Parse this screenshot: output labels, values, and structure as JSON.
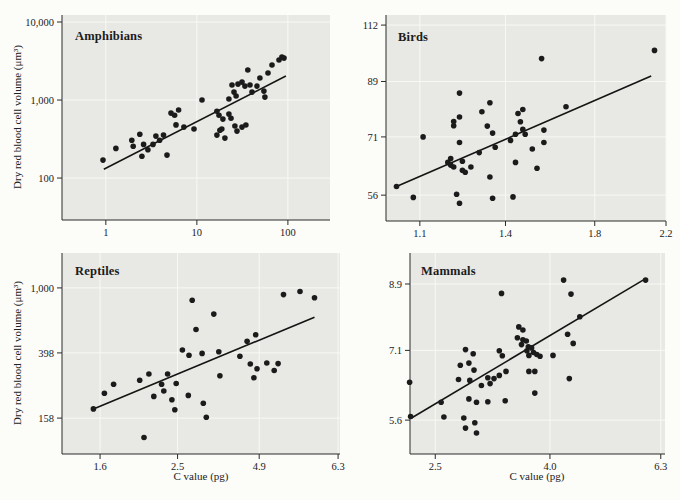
{
  "labels": {
    "xlabel": "C value (pg)",
    "ylabel": "Dry red blood cell volume (μm³)"
  },
  "style": {
    "page_bg": "#fcfcf9",
    "panel_bg": "#e8e8e4",
    "grid_color": "#f8f8f5",
    "axis_color": "#2a2a2a",
    "dot_color": "#1b1b1b",
    "trend_color": "#141414",
    "text_color": "#222222"
  },
  "chart_data": [
    {
      "type": "scatter",
      "title": "Amphibians",
      "xlabel": "C value (pg)",
      "ylabel": "Dry red blood cell volume (μm³)",
      "x_scale": "log",
      "y_scale": "log",
      "xlim": [
        0.33,
        290
      ],
      "ylim": [
        29,
        12300
      ],
      "x_ticks": [
        {
          "v": 1,
          "label": "1"
        },
        {
          "v": 10,
          "label": "10"
        },
        {
          "v": 100,
          "label": "100"
        }
      ],
      "y_ticks": [
        {
          "v": 100,
          "label": "100"
        },
        {
          "v": 1000,
          "label": "1,000"
        },
        {
          "v": 10000,
          "label": "10,000"
        }
      ],
      "trend_line": {
        "x1": 0.95,
        "y1": 130,
        "x2": 95,
        "y2": 2030
      },
      "points": [
        [
          0.93,
          170
        ],
        [
          1.29,
          240
        ],
        [
          1.93,
          305
        ],
        [
          2.0,
          255
        ],
        [
          2.36,
          365
        ],
        [
          2.49,
          190
        ],
        [
          2.6,
          270
        ],
        [
          2.9,
          230
        ],
        [
          3.3,
          270
        ],
        [
          3.55,
          345
        ],
        [
          3.9,
          305
        ],
        [
          4.3,
          355
        ],
        [
          4.7,
          197
        ],
        [
          5.2,
          680
        ],
        [
          5.7,
          640
        ],
        [
          5.9,
          480
        ],
        [
          6.3,
          745
        ],
        [
          7.2,
          450
        ],
        [
          9.3,
          425
        ],
        [
          11.4,
          1000
        ],
        [
          16.6,
          720
        ],
        [
          16.6,
          355
        ],
        [
          17.5,
          640
        ],
        [
          17.9,
          410
        ],
        [
          18.8,
          425
        ],
        [
          19.3,
          570
        ],
        [
          20.3,
          325
        ],
        [
          22.5,
          1030
        ],
        [
          22.5,
          660
        ],
        [
          23.7,
          585
        ],
        [
          24.3,
          1560
        ],
        [
          25.6,
          1265
        ],
        [
          27,
          1125
        ],
        [
          26.2,
          465
        ],
        [
          27.6,
          400
        ],
        [
          28.3,
          1600
        ],
        [
          31.3,
          1700
        ],
        [
          31.3,
          450
        ],
        [
          33.7,
          1510
        ],
        [
          34.6,
          478
        ],
        [
          36.3,
          2425
        ],
        [
          38.3,
          1560
        ],
        [
          40.3,
          1265
        ],
        [
          45.7,
          1510
        ],
        [
          49.3,
          1915
        ],
        [
          54.5,
          1300
        ],
        [
          55.9,
          1090
        ],
        [
          60.5,
          2220
        ],
        [
          66.8,
          2810
        ],
        [
          79.8,
          3260
        ],
        [
          86,
          3555
        ],
        [
          90.5,
          3450
        ]
      ]
    },
    {
      "type": "scatter",
      "title": "Birds",
      "xlabel": "C value (pg)",
      "ylabel": "Dry red blood cell volume (μm³)",
      "x_scale": "log",
      "y_scale": "log",
      "xlim": [
        1.0,
        2.2
      ],
      "ylim": [
        50.4,
        116.7
      ],
      "x_ticks": [
        {
          "v": 1.1,
          "label": "1.1"
        },
        {
          "v": 1.4,
          "label": "1.4"
        },
        {
          "v": 1.8,
          "label": "1.8"
        },
        {
          "v": 2.2,
          "label": "2.2"
        }
      ],
      "y_ticks": [
        {
          "v": 56,
          "label": "56"
        },
        {
          "v": 71,
          "label": "71"
        },
        {
          "v": 89,
          "label": "89"
        },
        {
          "v": 112,
          "label": "112"
        }
      ],
      "trend_line": {
        "x1": 1.03,
        "y1": 58,
        "x2": 2.11,
        "y2": 91
      },
      "points": [
        [
          1.03,
          58
        ],
        [
          1.08,
          55.5
        ],
        [
          1.11,
          71
        ],
        [
          1.19,
          64
        ],
        [
          1.2,
          65
        ],
        [
          1.2,
          63.3
        ],
        [
          1.21,
          75.6
        ],
        [
          1.21,
          74.3
        ],
        [
          1.21,
          62.8
        ],
        [
          1.22,
          56.2
        ],
        [
          1.23,
          84.9
        ],
        [
          1.23,
          77
        ],
        [
          1.23,
          54.2
        ],
        [
          1.23,
          69.4
        ],
        [
          1.24,
          64.3
        ],
        [
          1.24,
          62
        ],
        [
          1.25,
          61.5
        ],
        [
          1.27,
          62.8
        ],
        [
          1.3,
          66.6
        ],
        [
          1.31,
          78.7
        ],
        [
          1.33,
          74.2
        ],
        [
          1.34,
          81.6
        ],
        [
          1.35,
          72.1
        ],
        [
          1.36,
          68.1
        ],
        [
          1.34,
          60.3
        ],
        [
          1.35,
          55.3
        ],
        [
          1.43,
          55.6
        ],
        [
          1.42,
          70
        ],
        [
          1.44,
          71.8
        ],
        [
          1.45,
          78.1
        ],
        [
          1.46,
          75.5
        ],
        [
          1.47,
          79.4
        ],
        [
          1.47,
          73.2
        ],
        [
          1.48,
          71.8
        ],
        [
          1.44,
          64
        ],
        [
          1.51,
          67.6
        ],
        [
          1.53,
          62.5
        ],
        [
          1.56,
          69.4
        ],
        [
          1.56,
          73
        ],
        [
          1.55,
          97.7
        ],
        [
          1.66,
          80.3
        ],
        [
          2.13,
          101
        ]
      ]
    },
    {
      "type": "scatter",
      "title": "Reptiles",
      "xlabel": "C value (pg)",
      "ylabel": "Dry red blood cell volume (μm³)",
      "x_scale": "log",
      "y_scale": "log",
      "xlim": [
        1.285,
        6.37
      ],
      "ylim": [
        95,
        1640
      ],
      "x_ticks": [
        {
          "v": 1.6,
          "label": "1.6"
        },
        {
          "v": 2.5,
          "label": "2.5"
        },
        {
          "v": 4.0,
          "label": "4.9"
        },
        {
          "v": 6.3,
          "label": "6.3"
        }
      ],
      "y_ticks": [
        {
          "v": 158,
          "label": "158"
        },
        {
          "v": 398,
          "label": "398"
        },
        {
          "v": 1000,
          "label": "1,000"
        }
      ],
      "trend_line": {
        "x1": 1.54,
        "y1": 180,
        "x2": 5.5,
        "y2": 660
      },
      "points": [
        [
          1.54,
          180
        ],
        [
          1.64,
          225
        ],
        [
          1.73,
          255
        ],
        [
          2.01,
          270
        ],
        [
          2.06,
          120
        ],
        [
          2.12,
          295
        ],
        [
          2.18,
          215
        ],
        [
          2.28,
          255
        ],
        [
          2.31,
          232
        ],
        [
          2.36,
          295
        ],
        [
          2.42,
          205
        ],
        [
          2.46,
          178
        ],
        [
          2.48,
          258
        ],
        [
          2.57,
          415
        ],
        [
          2.66,
          218
        ],
        [
          2.67,
          385
        ],
        [
          2.72,
          840
        ],
        [
          2.78,
          555
        ],
        [
          2.88,
          395
        ],
        [
          2.9,
          195
        ],
        [
          2.95,
          160
        ],
        [
          3.08,
          690
        ],
        [
          3.17,
          405
        ],
        [
          3.19,
          288
        ],
        [
          3.58,
          380
        ],
        [
          3.73,
          470
        ],
        [
          3.8,
          340
        ],
        [
          3.88,
          280
        ],
        [
          3.92,
          515
        ],
        [
          3.95,
          318
        ],
        [
          4.18,
          345
        ],
        [
          4.36,
          310
        ],
        [
          4.46,
          342
        ],
        [
          4.6,
          910
        ],
        [
          5.06,
          950
        ],
        [
          5.5,
          870
        ]
      ]
    },
    {
      "type": "scatter",
      "title": "Mammals",
      "xlabel": "C value (pg)",
      "ylabel": "Dry red blood cell volume (μm³)",
      "x_scale": "log",
      "y_scale": "log",
      "xlim": [
        2.254,
        6.41
      ],
      "ylim": [
        4.99,
        9.89
      ],
      "x_ticks": [
        {
          "v": 2.5,
          "label": "2.5"
        },
        {
          "v": 4.0,
          "label": "4.0"
        },
        {
          "v": 6.3,
          "label": "6.3"
        }
      ],
      "y_ticks": [
        {
          "v": 5.6,
          "label": "5.6"
        },
        {
          "v": 7.1,
          "label": "7.1"
        },
        {
          "v": 8.9,
          "label": "8.9"
        }
      ],
      "trend_line": {
        "x1": 2.26,
        "y1": 5.63,
        "x2": 5.9,
        "y2": 9.05
      },
      "points": [
        [
          2.25,
          6.37
        ],
        [
          2.26,
          5.67
        ],
        [
          2.56,
          5.95
        ],
        [
          2.59,
          5.66
        ],
        [
          2.81,
          5.64
        ],
        [
          2.83,
          5.45
        ],
        [
          2.94,
          5.55
        ],
        [
          2.96,
          5.36
        ],
        [
          2.87,
          6.02
        ],
        [
          2.96,
          5.95
        ],
        [
          3.1,
          5.96
        ],
        [
          3.33,
          5.98
        ],
        [
          2.77,
          6.75
        ],
        [
          2.87,
          6.8
        ],
        [
          2.93,
          6.64
        ],
        [
          2.83,
          7.12
        ],
        [
          2.92,
          7.02
        ],
        [
          2.75,
          6.43
        ],
        [
          2.88,
          6.41
        ],
        [
          3.02,
          6.3
        ],
        [
          3.13,
          6.34
        ],
        [
          3.1,
          6.47
        ],
        [
          3.18,
          6.45
        ],
        [
          3.25,
          6.52
        ],
        [
          3.29,
          6.97
        ],
        [
          3.25,
          7.09
        ],
        [
          3.28,
          8.62
        ],
        [
          3.52,
          7.69
        ],
        [
          3.58,
          7.61
        ],
        [
          3.5,
          7.41
        ],
        [
          3.58,
          7.36
        ],
        [
          3.56,
          7.24
        ],
        [
          3.63,
          7.33
        ],
        [
          3.66,
          7.19
        ],
        [
          3.64,
          7.09
        ],
        [
          3.71,
          7.16
        ],
        [
          3.74,
          7.05
        ],
        [
          3.67,
          6.98
        ],
        [
          3.79,
          7.0
        ],
        [
          3.34,
          6.61
        ],
        [
          3.67,
          6.61
        ],
        [
          3.76,
          6.61
        ],
        [
          3.76,
          6.14
        ],
        [
          3.84,
          6.96
        ],
        [
          4.05,
          6.98
        ],
        [
          4.23,
          9.02
        ],
        [
          4.36,
          8.6
        ],
        [
          4.52,
          7.96
        ],
        [
          4.3,
          7.5
        ],
        [
          4.4,
          7.27
        ],
        [
          4.33,
          6.45
        ],
        [
          5.92,
          9.02
        ]
      ]
    }
  ]
}
